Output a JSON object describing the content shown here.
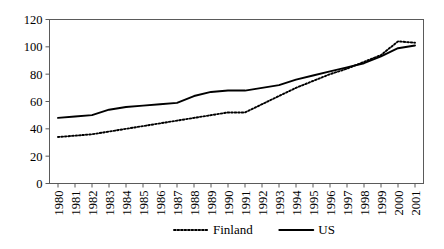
{
  "chart_data": {
    "type": "line",
    "title": "",
    "subtitle": "",
    "xlabel": "",
    "ylabel": "",
    "categories": [
      "1980",
      "1981",
      "1982",
      "1983",
      "1984",
      "1985",
      "1986",
      "1987",
      "1988",
      "1989",
      "1990",
      "1991",
      "1992",
      "1993",
      "1994",
      "1995",
      "1996",
      "1997",
      "1998",
      "1999",
      "2000",
      "2001"
    ],
    "series": [
      {
        "name": "Finland",
        "style": "dotted",
        "color": "#000000",
        "values": [
          34,
          35,
          36,
          38,
          40,
          42,
          44,
          46,
          48,
          50,
          52,
          52,
          58,
          64,
          70,
          75,
          80,
          84,
          89,
          94,
          104,
          103
        ]
      },
      {
        "name": "US",
        "style": "solid",
        "color": "#000000",
        "values": [
          48,
          49,
          50,
          54,
          56,
          57,
          58,
          59,
          64,
          67,
          68,
          68,
          70,
          72,
          76,
          79,
          82,
          85,
          88,
          93,
          99,
          101
        ]
      }
    ],
    "ylim": [
      0,
      120
    ],
    "yticks": [
      0,
      20,
      40,
      60,
      80,
      100,
      120
    ],
    "grid": false,
    "legend_position": "bottom",
    "xtick_rotation": 90
  },
  "legend": {
    "entries": [
      {
        "label": "Finland",
        "style": "dotted"
      },
      {
        "label": "US",
        "style": "solid"
      }
    ]
  },
  "axes": {
    "y_tick_labels": [
      "0",
      "20",
      "40",
      "60",
      "80",
      "100",
      "120"
    ],
    "x_tick_labels": [
      "1980",
      "1981",
      "1982",
      "1983",
      "1984",
      "1985",
      "1986",
      "1987",
      "1988",
      "1989",
      "1990",
      "1991",
      "1992",
      "1993",
      "1994",
      "1995",
      "1996",
      "1997",
      "1998",
      "1999",
      "2000",
      "2001"
    ]
  }
}
